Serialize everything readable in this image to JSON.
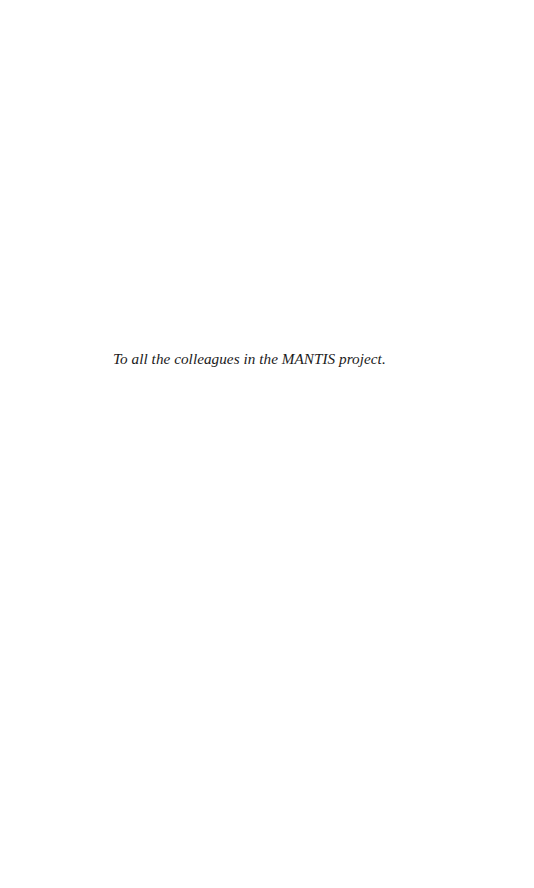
{
  "page": {
    "type": "dedication",
    "background_color": "#ffffff",
    "text_color": "#1a1a1a"
  },
  "dedication": {
    "text": "To all the colleagues in the MANTIS project."
  }
}
